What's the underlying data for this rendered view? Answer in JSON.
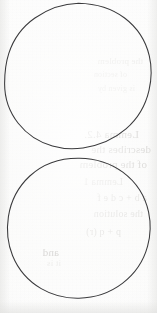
{
  "page": {
    "kind": "scanned-paper-sheet",
    "width": 157,
    "height": 313,
    "background_color": "#fdfdfc",
    "paper_tint_color": "#f9f9f8",
    "edge_shadow_color": "#e2e2e0"
  },
  "ink": {
    "stroke_color": "#3a3a3c",
    "stroke_width": 1.05,
    "description": "two hand-drawn pencil circles, slightly irregular outlines"
  },
  "shapes": [
    {
      "name": "upper-circle",
      "type": "circle",
      "center_x": 78,
      "center_y": 76,
      "radius": 73,
      "bounds": {
        "top": 3,
        "bottom": 149,
        "left": 5,
        "right": 151
      }
    },
    {
      "name": "lower-circle",
      "type": "circle",
      "center_x": 79,
      "center_y": 230,
      "radius": 72,
      "bounds": {
        "top": 158,
        "bottom": 302,
        "left": 7,
        "right": 151
      }
    }
  ],
  "bleed_through": {
    "note": "faint mirrored show-through text from the reverse side of the sheet",
    "text_color": "#b9b6b2",
    "mirrored": true,
    "lines": [
      {
        "text": "the problem",
        "x": 14,
        "y": 56,
        "size": 9,
        "weight": "faint"
      },
      {
        "text": "of section",
        "x": 30,
        "y": 70,
        "size": 8,
        "weight": "faint"
      },
      {
        "text": "is given by",
        "x": 22,
        "y": 84,
        "size": 8,
        "weight": "faint"
      },
      {
        "text": "Lemma 4.2.",
        "x": 18,
        "y": 128,
        "size": 11,
        "weight": "strong"
      },
      {
        "text": "describes the",
        "x": 6,
        "y": 143,
        "size": 11,
        "weight": "strong"
      },
      {
        "text": "of the problem",
        "x": 10,
        "y": 158,
        "size": 11,
        "weight": "strong"
      },
      {
        "text": "Lemma 1",
        "x": 34,
        "y": 176,
        "size": 10,
        "weight": "normal"
      },
      {
        "text": "a b + c d e f",
        "x": 10,
        "y": 192,
        "size": 10,
        "weight": "normal"
      },
      {
        "text": "the solution",
        "x": 14,
        "y": 208,
        "size": 10,
        "weight": "normal"
      },
      {
        "text": "p + q (r)",
        "x": 36,
        "y": 226,
        "size": 10,
        "weight": "normal"
      },
      {
        "text": "and",
        "x": 98,
        "y": 246,
        "size": 11,
        "weight": "strong"
      },
      {
        "text": "it is",
        "x": 96,
        "y": 258,
        "size": 9,
        "weight": "faint"
      }
    ]
  }
}
